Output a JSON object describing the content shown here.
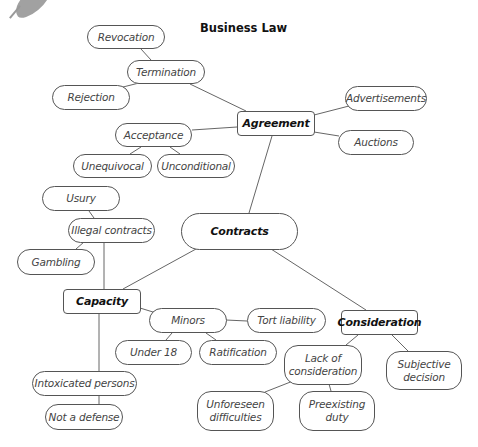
{
  "title": "Business Law",
  "decoration": {
    "icon": "leaf-icon",
    "color": "#8a8a8a"
  },
  "colors": {
    "line": "#666666",
    "border": "#555555",
    "background": "#ffffff",
    "text": "#444444"
  },
  "nodes": {
    "contracts": {
      "label": "Contracts",
      "style": "bold"
    },
    "agreement": {
      "label": "Agreement",
      "style": "bold-rect"
    },
    "capacity": {
      "label": "Capacity",
      "style": "bold-rect"
    },
    "consideration": {
      "label": "Consideration",
      "style": "bold-rect"
    },
    "termination": {
      "label": "Termination"
    },
    "revocation": {
      "label": "Revocation"
    },
    "rejection": {
      "label": "Rejection"
    },
    "acceptance": {
      "label": "Acceptance"
    },
    "unequivocal": {
      "label": "Unequivocal"
    },
    "unconditional": {
      "label": "Unconditional"
    },
    "advertisements": {
      "label": "Advertisements"
    },
    "auctions": {
      "label": "Auctions"
    },
    "illegal_contracts": {
      "label": "Illegal contracts"
    },
    "usury": {
      "label": "Usury"
    },
    "gambling": {
      "label": "Gambling"
    },
    "minors": {
      "label": "Minors"
    },
    "under_18": {
      "label": "Under 18"
    },
    "ratification": {
      "label": "Ratification"
    },
    "tort_liability": {
      "label": "Tort liability"
    },
    "intoxicated_persons": {
      "label": "Intoxicated persons"
    },
    "not_a_defense": {
      "label": "Not a defense"
    },
    "lack_of_consideration": {
      "label": "Lack of consideration"
    },
    "unforeseen_difficulties": {
      "label": "Unforeseen difficulties"
    },
    "preexisting_duty": {
      "label": "Preexisting duty"
    },
    "subjective_decision": {
      "label": "Subjective decision"
    }
  },
  "edges": [
    [
      "contracts",
      "agreement"
    ],
    [
      "contracts",
      "capacity"
    ],
    [
      "contracts",
      "consideration"
    ],
    [
      "agreement",
      "termination"
    ],
    [
      "termination",
      "revocation"
    ],
    [
      "termination",
      "rejection"
    ],
    [
      "agreement",
      "acceptance"
    ],
    [
      "acceptance",
      "unequivocal"
    ],
    [
      "acceptance",
      "unconditional"
    ],
    [
      "agreement",
      "advertisements"
    ],
    [
      "agreement",
      "auctions"
    ],
    [
      "capacity",
      "illegal_contracts"
    ],
    [
      "illegal_contracts",
      "usury"
    ],
    [
      "illegal_contracts",
      "gambling"
    ],
    [
      "capacity",
      "minors"
    ],
    [
      "minors",
      "under_18"
    ],
    [
      "minors",
      "ratification"
    ],
    [
      "minors",
      "tort_liability"
    ],
    [
      "capacity",
      "intoxicated_persons"
    ],
    [
      "intoxicated_persons",
      "not_a_defense"
    ],
    [
      "consideration",
      "lack_of_consideration"
    ],
    [
      "lack_of_consideration",
      "unforeseen_difficulties"
    ],
    [
      "lack_of_consideration",
      "preexisting_duty"
    ],
    [
      "consideration",
      "subjective_decision"
    ]
  ]
}
